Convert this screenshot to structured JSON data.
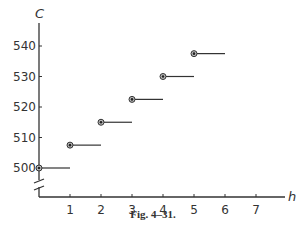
{
  "chart_data": {
    "type": "scatter",
    "style": "step",
    "title": "",
    "caption": "Fig. 4–31.",
    "xlabel": "h",
    "ylabel": "C",
    "x_ticks": [
      1,
      2,
      3,
      4,
      5,
      6,
      7
    ],
    "y_ticks": [
      500,
      510,
      520,
      530,
      540
    ],
    "xlim": [
      0,
      8
    ],
    "ylim": [
      500,
      545
    ],
    "y_axis_break": true,
    "grid": false,
    "legend": null,
    "series": [
      {
        "name": "C(h)",
        "x": [
          0,
          1,
          2,
          3,
          4,
          5
        ],
        "values": [
          500,
          507.5,
          515,
          522.5,
          530,
          537.5
        ],
        "segment_length": 1
      }
    ]
  },
  "color": "#333333"
}
